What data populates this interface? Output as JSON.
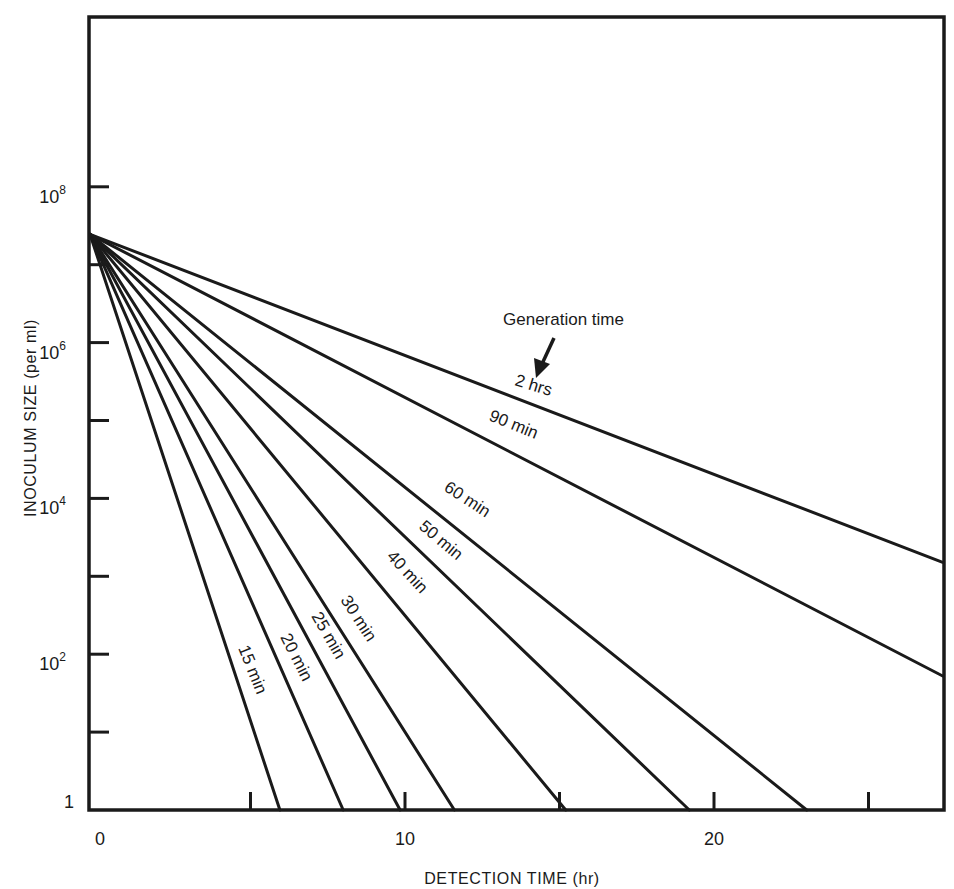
{
  "chart_data": {
    "type": "line",
    "title": "",
    "xlabel": "DETECTION TIME (hr)",
    "ylabel": "INOCULUM SIZE (per ml)",
    "xlim": [
      0,
      27.4
    ],
    "ylim_log10": [
      0,
      9.8
    ],
    "yscale": "log",
    "grid": false,
    "legend": "none (inline labels)",
    "x_ticks": [
      0,
      5,
      10,
      15,
      20,
      25
    ],
    "x_tick_labels": [
      "0",
      "",
      "10",
      "",
      "20",
      ""
    ],
    "y_ticks_log10": [
      0,
      1,
      2,
      3,
      4,
      5,
      6,
      7,
      8
    ],
    "y_tick_labels": [
      {
        "log10": 0,
        "base": "1",
        "exp": ""
      },
      {
        "log10": 2,
        "base": "10",
        "exp": "2"
      },
      {
        "log10": 4,
        "base": "10",
        "exp": "4"
      },
      {
        "log10": 6,
        "base": "10",
        "exp": "6"
      },
      {
        "log10": 8,
        "base": "10",
        "exp": "8"
      }
    ],
    "annotation": {
      "text": "Generation time",
      "arrow_to": "2 hrs"
    },
    "origin": {
      "x_hr": 0,
      "y_log10": 7.39
    },
    "series": [
      {
        "name": "15 min",
        "points": [
          [
            0,
            7.39
          ],
          [
            5.95,
            0
          ]
        ]
      },
      {
        "name": "20 min",
        "points": [
          [
            0,
            7.39
          ],
          [
            8.0,
            0
          ]
        ]
      },
      {
        "name": "25 min",
        "points": [
          [
            0,
            7.39
          ],
          [
            9.84,
            0
          ]
        ]
      },
      {
        "name": "30 min",
        "points": [
          [
            0,
            7.39
          ],
          [
            11.6,
            0
          ]
        ]
      },
      {
        "name": "40 min",
        "points": [
          [
            0,
            7.39
          ],
          [
            15.2,
            0
          ]
        ]
      },
      {
        "name": "50 min",
        "points": [
          [
            0,
            7.39
          ],
          [
            19.2,
            0
          ]
        ]
      },
      {
        "name": "60 min",
        "points": [
          [
            0,
            7.39
          ],
          [
            23.0,
            0
          ]
        ]
      },
      {
        "name": "90 min",
        "points": [
          [
            0,
            7.39
          ],
          [
            27.4,
            1.72
          ]
        ]
      },
      {
        "name": "2 hrs",
        "points": [
          [
            0,
            7.39
          ],
          [
            27.4,
            3.18
          ]
        ]
      }
    ]
  },
  "layout": {
    "plot": {
      "left": 89,
      "top": 17,
      "right": 944,
      "bottom": 810
    },
    "x0_px": 96,
    "px_per_hr": 30.9,
    "px_per_decade": 77.9
  },
  "labels": {
    "series_labels": [
      {
        "name": "15 min",
        "x": 238,
        "y": 648,
        "angle": 68
      },
      {
        "name": "20 min",
        "x": 280,
        "y": 637,
        "angle": 63
      },
      {
        "name": "25 min",
        "x": 311,
        "y": 616,
        "angle": 60
      },
      {
        "name": "30 min",
        "x": 340,
        "y": 600,
        "angle": 57
      },
      {
        "name": "40 min",
        "x": 386,
        "y": 557,
        "angle": 47
      },
      {
        "name": "50 min",
        "x": 418,
        "y": 528,
        "angle": 40
      },
      {
        "name": "60 min",
        "x": 443,
        "y": 490,
        "angle": 33
      },
      {
        "name": "90 min",
        "x": 488,
        "y": 420,
        "angle": 22
      },
      {
        "name": "2 hrs",
        "x": 514,
        "y": 385,
        "angle": 17
      }
    ],
    "annotation_pos": {
      "x": 503,
      "y": 325
    }
  }
}
